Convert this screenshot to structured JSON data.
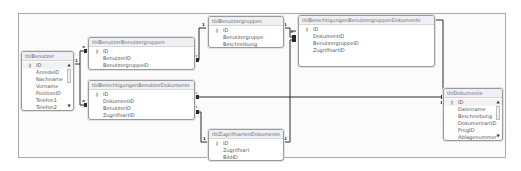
{
  "diagram": {
    "type": "database-relationships",
    "tables": [
      {
        "id": "tblBenutzer",
        "name": "tblBenutzer",
        "primary_key": "ID",
        "fields": [
          "ID",
          "AnredeID",
          "Nachname",
          "Vorname",
          "PositionID",
          "Telefon1",
          "Telefon2"
        ],
        "scrollable": true
      },
      {
        "id": "tblBenutzerBenutzergruppen",
        "name": "tblBenutzerBenutzergruppen",
        "primary_key": "ID",
        "fields": [
          "ID",
          "BenutzerID",
          "BenutzergruppeID"
        ],
        "scrollable": false
      },
      {
        "id": "tblBenutzergruppen",
        "name": "tblBenutzergruppen",
        "primary_key": "ID",
        "fields": [
          "ID",
          "Benutzergruppe",
          "Beschreibung"
        ],
        "scrollable": false
      },
      {
        "id": "tblBerechtigungenBenutzergruppenDokumente",
        "name": "tblBerechtigungenBenutzergruppenDokumente",
        "primary_key": "ID",
        "fields": [
          "ID",
          "DokumentID",
          "BenutzergruppeID",
          "ZugriffsartID"
        ],
        "scrollable": false
      },
      {
        "id": "tblBerechtigungenBenutzerDokumente",
        "name": "tblBerechtigungenBenutzerDokumente",
        "primary_key": "ID",
        "fields": [
          "ID",
          "DokumentID",
          "BenutzerID",
          "ZugriffsartID"
        ],
        "scrollable": false
      },
      {
        "id": "tblZugriffsartenDokumente",
        "name": "tblZugriffsartenDokumente",
        "primary_key": "ID",
        "fields": [
          "ID",
          "Zugriffsart",
          "BildID"
        ],
        "scrollable": false
      },
      {
        "id": "tblDokumente",
        "name": "tblDokumente",
        "primary_key": "ID",
        "fields": [
          "ID",
          "Dateiname",
          "Beschreibung",
          "DokumentartID",
          "ProgID",
          "Ablagenummer"
        ],
        "scrollable": true
      }
    ],
    "relationships": [
      {
        "from": "tblBenutzer.ID",
        "to": "tblBenutzerBenutzergruppen.BenutzerID",
        "from_card": "1",
        "to_card": "∞"
      },
      {
        "from": "tblBenutzer.ID",
        "to": "tblBerechtigungenBenutzerDokumente.BenutzerID",
        "from_card": "1",
        "to_card": "∞"
      },
      {
        "from": "tblBenutzergruppen.ID",
        "to": "tblBenutzerBenutzergruppen.BenutzergruppeID",
        "from_card": "1",
        "to_card": "∞"
      },
      {
        "from": "tblBenutzergruppen.ID",
        "to": "tblBerechtigungenBenutzergruppenDokumente.BenutzergruppeID",
        "from_card": "1",
        "to_card": "∞"
      },
      {
        "from": "tblZugriffsartenDokumente.ID",
        "to": "tblBerechtigungenBenutzerDokumente.ZugriffsartID",
        "from_card": "1",
        "to_card": "∞"
      },
      {
        "from": "tblZugriffsartenDokumente.ID",
        "to": "tblBerechtigungenBenutzergruppenDokumente.ZugriffsartID",
        "from_card": "1",
        "to_card": "∞"
      },
      {
        "from": "tblDokumente.ID",
        "to": "tblBerechtigungenBenutzerDokumente.DokumentID",
        "from_card": "1",
        "to_card": "∞"
      },
      {
        "from": "tblDokumente.ID",
        "to": "tblBerechtigungenBenutzergruppenDokumente.DokumentID",
        "from_card": "1",
        "to_card": "∞"
      }
    ],
    "key_icon": "key-icon",
    "scroll_up_icon": "▲",
    "scroll_down_icon": "▼",
    "colors": {
      "line": "#2a2a2a",
      "table_border": "#9a9a9a",
      "title_bg": "#eef0f3",
      "title_text": "#6a6f7a",
      "field_text": "#555555"
    }
  }
}
